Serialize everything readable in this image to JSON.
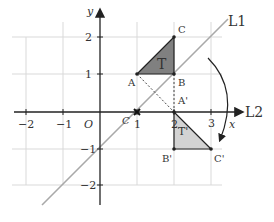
{
  "diagram": {
    "axes": {
      "x_label": "x",
      "y_label": "y",
      "origin_label": "O",
      "x_ticks": [
        "−2",
        "−1",
        "1",
        "2",
        "3"
      ],
      "y_ticks": [
        "2",
        "1",
        "−1",
        "−2"
      ]
    },
    "lines": {
      "l1": "L1",
      "l2": "L2"
    },
    "triangle_T": {
      "label": "T",
      "vertices": {
        "A": "A",
        "B": "B",
        "C": "C"
      },
      "coords": {
        "A": [
          1,
          1
        ],
        "B": [
          2,
          1
        ],
        "C": [
          2,
          2
        ]
      },
      "fill": "#808080"
    },
    "triangle_T_prime": {
      "label": "T'",
      "vertices": {
        "A": "A'",
        "B": "B'",
        "C": "C'"
      },
      "coords": {
        "A": [
          2,
          0
        ],
        "B": [
          2,
          -1
        ],
        "C": [
          3,
          -1
        ]
      },
      "fill": "#d3d3d3"
    },
    "center_point": {
      "label": "C",
      "coords": [
        1,
        0
      ]
    },
    "colors": {
      "grid": "#d9d9d9",
      "axis": "#222222",
      "line_L1": "#a9a9a9",
      "triangle_T": "#808080",
      "triangle_T_prime": "#d3d3d3"
    }
  }
}
